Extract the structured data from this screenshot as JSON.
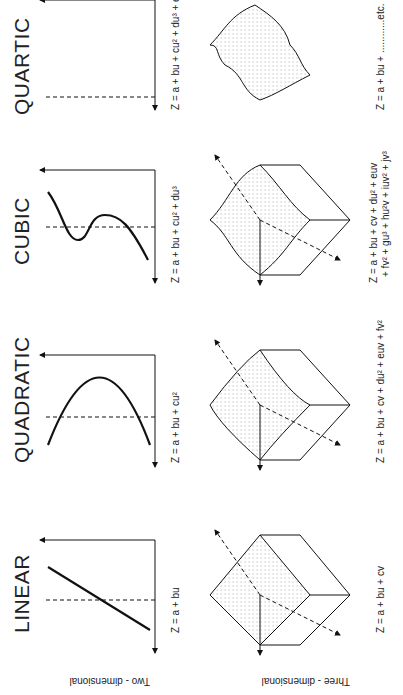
{
  "orientation": "rotated 90 degrees counter-clockwise",
  "row_labels": {
    "two_d": "Two - dimensional",
    "three_d": "Three - dimensional"
  },
  "columns": [
    {
      "title": "LINEAR",
      "eq2d": "Z = a + bu",
      "eq3d": "Z = a + bu + cv"
    },
    {
      "title": "QUADRATIC",
      "eq2d": "Z = a + bu + cu²",
      "eq3d": "Z = a + bu + cv + du² + euv + fv²"
    },
    {
      "title": "CUBIC",
      "eq2d": "Z = a + bu + cu² + du³",
      "eq3d_line1": "Z = a + bu + cv + du² + euv",
      "eq3d_line2": "+ fv² + gu³ + hu²v + iuv² + jv³"
    },
    {
      "title": "QUARTIC",
      "eq2d": "Z = a + bu + cu² + du³ + eu⁴",
      "eq3d": "Z = a + bu + ............etc."
    }
  ],
  "axis_labels": {
    "z": "Z",
    "u": "U",
    "v": "V"
  }
}
